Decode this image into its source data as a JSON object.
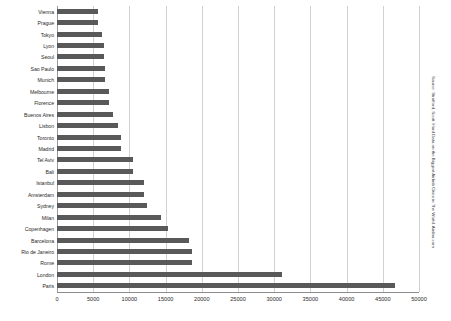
{
  "chart_data": {
    "type": "bar",
    "orientation": "horizontal",
    "title": "",
    "xlabel": "",
    "ylabel": "",
    "xlim": [
      0,
      50000
    ],
    "grid": true,
    "legend": false,
    "xticks": [
      "0",
      "5000",
      "10000",
      "15000",
      "20000",
      "25000",
      "30000",
      "35000",
      "40000",
      "45000",
      "50000"
    ],
    "xtick_values": [
      0,
      5000,
      10000,
      15000,
      20000,
      25000,
      30000,
      35000,
      40000,
      45000,
      50000
    ],
    "categories": [
      "Vienna",
      "Prague",
      "Tokyo",
      "Lyon",
      "Seoul",
      "Sao Paulo",
      "Munich",
      "Melbourne",
      "Florence",
      "Buenos Aires",
      "Lisbon",
      "Toronto",
      "Madrid",
      "Tel Aviv",
      "Bali",
      "Istanbul",
      "Amsterdam",
      "Sydney",
      "Milan",
      "Copenhagen",
      "Barcelona",
      "Rio de Janeiro",
      "Rome",
      "London",
      "Paris"
    ],
    "values": [
      5600,
      5700,
      6200,
      6500,
      6500,
      6600,
      6600,
      7200,
      7200,
      7700,
      8400,
      8900,
      8900,
      10500,
      10500,
      12000,
      12000,
      12400,
      14400,
      15400,
      18200,
      18600,
      18600,
      31100,
      46700
    ],
    "bar_color": "#595959",
    "grid_color": "#d0d0d0"
  },
  "source": {
    "note": "Source: Stratford, Scott. Hard Data on the Biggest Airbnb Cities in The World. Airdna.com"
  }
}
